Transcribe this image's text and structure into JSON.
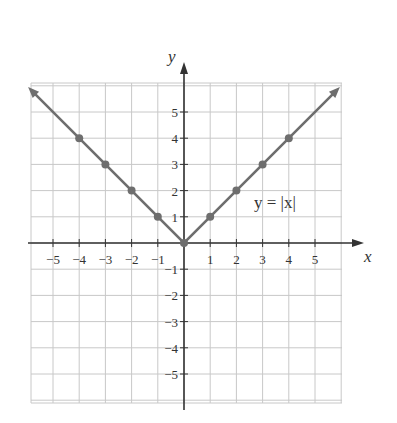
{
  "chart_data": {
    "type": "line",
    "title": "",
    "xlabel": "x",
    "ylabel": "y",
    "xlim": [
      -6,
      6
    ],
    "ylim": [
      -6,
      6
    ],
    "grid": true,
    "x_ticks": [
      -5,
      -4,
      -3,
      -2,
      -1,
      1,
      2,
      3,
      4,
      5
    ],
    "y_ticks": [
      -5,
      -4,
      -3,
      -2,
      -1,
      1,
      2,
      3,
      4,
      5
    ],
    "series": [
      {
        "name": "y = |x|",
        "equation": "y = |x|",
        "line_extends_with_arrows": true,
        "points": [
          {
            "x": -4,
            "y": 4
          },
          {
            "x": -3,
            "y": 3
          },
          {
            "x": -2,
            "y": 2
          },
          {
            "x": -1,
            "y": 1
          },
          {
            "x": 0,
            "y": 0
          },
          {
            "x": 1,
            "y": 1
          },
          {
            "x": 2,
            "y": 2
          },
          {
            "x": 3,
            "y": 3
          },
          {
            "x": 4,
            "y": 4
          }
        ]
      }
    ],
    "annotations": [
      {
        "text": "y = |x|",
        "x": 3.2,
        "y": 1.5
      }
    ]
  },
  "labels": {
    "x_axis": "x",
    "y_axis": "y",
    "equation": "y = |x|"
  },
  "colors": {
    "grid": "#c8c8c8",
    "axis": "#333333",
    "curve": "#6e6e6e",
    "point": "#6e6e6e"
  }
}
